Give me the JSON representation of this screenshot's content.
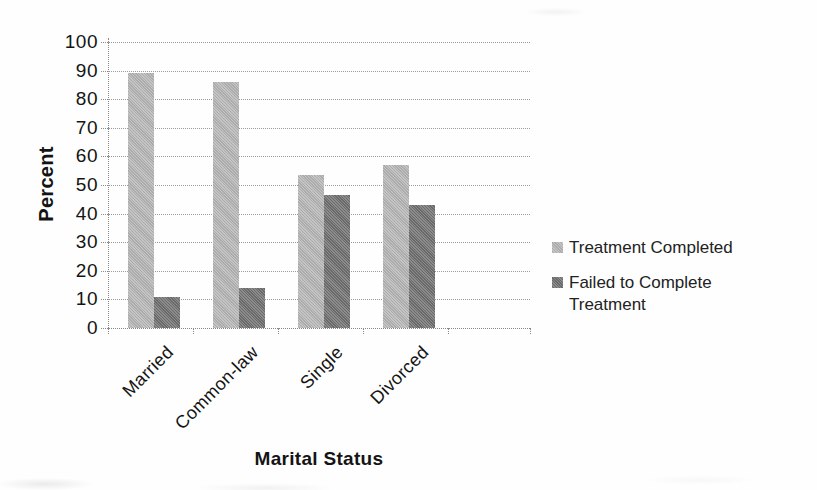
{
  "chart_data": {
    "type": "bar",
    "title": "",
    "xlabel": "Marital Status",
    "ylabel": "Percent",
    "categories": [
      "Married",
      "Common-law",
      "Single",
      "Divorced"
    ],
    "series": [
      {
        "name": "Treatment Completed",
        "color": "#b5b5b5",
        "values": [
          89,
          86,
          53.5,
          57
        ]
      },
      {
        "name": "Failed to Complete Treatment",
        "color": "#6f6f6f",
        "values": [
          11,
          14,
          46.5,
          43
        ]
      }
    ],
    "ylim": [
      0,
      100
    ],
    "ytick_step": 10,
    "ytick_labels": [
      "100",
      "90",
      "80",
      "70",
      "60",
      "50",
      "40",
      "30",
      "20",
      "10",
      "0"
    ],
    "grid": true,
    "legend_position": "right",
    "bar_texture": "halftone"
  },
  "colors": {
    "grid": "#9b9b9b",
    "axis": "#8a8a8a",
    "text": "#141414",
    "background": "#fefefe"
  }
}
